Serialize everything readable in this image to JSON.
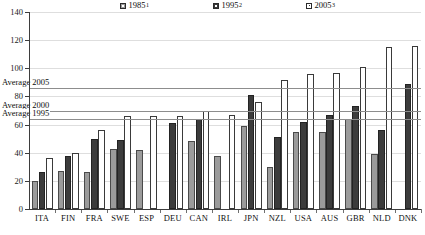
{
  "chart_data": {
    "type": "bar",
    "title": "",
    "subtitle": "",
    "xlabel": "",
    "ylabel": "",
    "ylim": [
      0,
      140
    ],
    "yticks": [
      0,
      20,
      40,
      60,
      80,
      100,
      120,
      140
    ],
    "grid": true,
    "legend_position": "top",
    "categories": [
      "ITA",
      "FIN",
      "FRA",
      "SWE",
      "ESP",
      "DEU",
      "CAN",
      "IRL",
      "JPN",
      "NZL",
      "USA",
      "AUS",
      "GBR",
      "NLD",
      "DNK"
    ],
    "series": [
      {
        "name": "1985",
        "note": "1",
        "color": "#9b9b9b",
        "values": [
          20,
          27,
          26,
          43,
          42,
          null,
          48,
          38,
          59,
          30,
          55,
          55,
          64,
          39,
          null
        ]
      },
      {
        "name": "1995",
        "note": "2",
        "color": "#3c3c3c",
        "values": [
          26,
          38,
          50,
          49,
          null,
          61,
          64,
          null,
          81,
          51,
          62,
          67,
          73,
          56,
          89
        ]
      },
      {
        "name": "2005",
        "note": "3",
        "color": "#ffffff",
        "values": [
          36,
          40,
          56,
          66,
          66,
          66,
          70,
          67,
          76,
          92,
          96,
          97,
          101,
          115,
          116
        ]
      }
    ],
    "reference_lines": [
      {
        "label": "Average 2005",
        "value": 86
      },
      {
        "label": "Average 2000",
        "value": 70
      },
      {
        "label": "Average 1995",
        "value": 64
      }
    ]
  },
  "legend": {
    "items": [
      {
        "label": "1985",
        "sup": "1"
      },
      {
        "label": "1995",
        "sup": "2"
      },
      {
        "label": "2005",
        "sup": "3"
      }
    ]
  }
}
